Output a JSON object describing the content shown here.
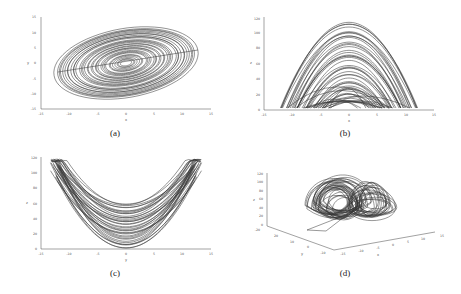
{
  "figure": {
    "panels": [
      {
        "id": "a",
        "caption": "(a)"
      },
      {
        "id": "b",
        "caption": "(b)"
      },
      {
        "id": "c",
        "caption": "(c)"
      },
      {
        "id": "d",
        "caption": "(d)"
      }
    ]
  },
  "chart_data": [
    {
      "type": "line",
      "title": "",
      "caption": "(a)",
      "xlabel": "x",
      "ylabel": "y",
      "xlim": [
        -15,
        15
      ],
      "ylim": [
        -15,
        15
      ],
      "xticks": [
        "-15",
        "-10",
        "-5",
        "0",
        "5",
        "10",
        "15"
      ],
      "yticks": [
        "-15",
        "-10",
        "-5",
        "0",
        "5",
        "10",
        "15"
      ],
      "description": "Phase portrait x-y: elliptical spiraling attractor centered near origin, x range approx -12..12, y range approx -12..11"
    },
    {
      "type": "line",
      "title": "",
      "caption": "(b)",
      "xlabel": "x",
      "ylabel": "z",
      "xlim": [
        -15,
        15
      ],
      "ylim": [
        0,
        120
      ],
      "xticks": [
        "-15",
        "-10",
        "-5",
        "0",
        "5",
        "10",
        "15"
      ],
      "yticks": [
        "0",
        "20",
        "40",
        "60",
        "80",
        "100",
        "120"
      ],
      "description": "Phase portrait x-z: dome-shaped attractor, x approx -12..12, z approx 0..110"
    },
    {
      "type": "line",
      "title": "",
      "caption": "(c)",
      "xlabel": "y",
      "ylabel": "z",
      "xlim": [
        -15,
        15
      ],
      "ylim": [
        0,
        120
      ],
      "xticks": [
        "-15",
        "-10",
        "-5",
        "0",
        "5",
        "10",
        "15"
      ],
      "yticks": [
        "0",
        "20",
        "40",
        "60",
        "80",
        "100",
        "120"
      ],
      "description": "Phase portrait y-z: U-shaped (parabolic) attractor, y approx -12..13, z approx 0..110"
    },
    {
      "type": "line",
      "title": "",
      "caption": "(d)",
      "xlabel": "x",
      "ylabel": "y",
      "zlabel": "z",
      "xlim": [
        -15,
        15
      ],
      "ylim": [
        -20,
        20
      ],
      "zlim": [
        0,
        120
      ],
      "xticks": [
        "-15",
        "-10",
        "-5",
        "0",
        "5",
        "10",
        "15"
      ],
      "yticks": [
        "-20",
        "-10",
        "0",
        "10",
        "20"
      ],
      "zticks": [
        "0",
        "20",
        "40",
        "60",
        "80",
        "100",
        "120"
      ],
      "description": "3D phase portrait x-y-z of chaotic attractor"
    }
  ]
}
